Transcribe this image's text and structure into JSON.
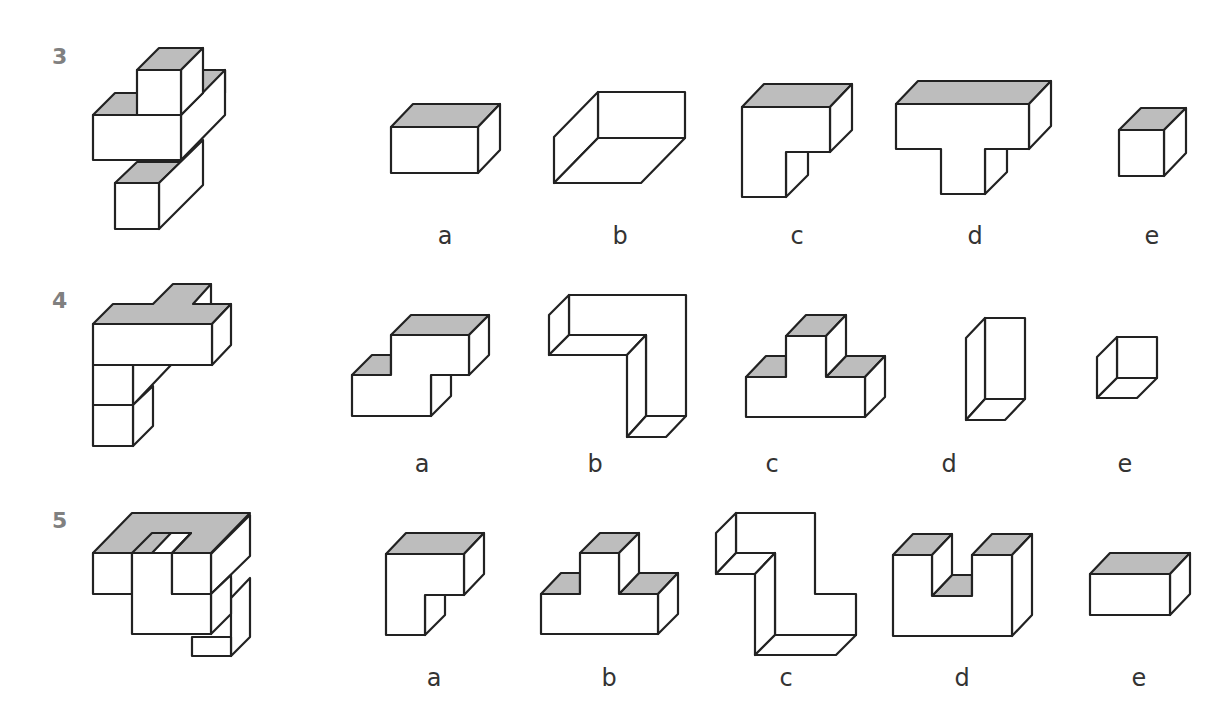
{
  "puzzles": [
    {
      "number": "3",
      "options": [
        {
          "label": "a",
          "shape": "rectangular-block"
        },
        {
          "label": "b",
          "shape": "open-tray"
        },
        {
          "label": "c",
          "shape": "l-block"
        },
        {
          "label": "d",
          "shape": "t-block"
        },
        {
          "label": "e",
          "shape": "cube"
        }
      ]
    },
    {
      "number": "4",
      "options": [
        {
          "label": "a",
          "shape": "step-block"
        },
        {
          "label": "b",
          "shape": "l-frame-hollow"
        },
        {
          "label": "c",
          "shape": "t-step-block"
        },
        {
          "label": "d",
          "shape": "tall-hollow-prism"
        },
        {
          "label": "e",
          "shape": "hollow-cube"
        }
      ]
    },
    {
      "number": "5",
      "options": [
        {
          "label": "a",
          "shape": "l-block"
        },
        {
          "label": "b",
          "shape": "t-step-block"
        },
        {
          "label": "c",
          "shape": "z-frame-hollow"
        },
        {
          "label": "d",
          "shape": "u-block"
        },
        {
          "label": "e",
          "shape": "rectangular-block"
        }
      ]
    }
  ],
  "colors": {
    "face_shaded": "#bdbdbd",
    "outline": "#222222",
    "number_text": "#808080",
    "label_text": "#333333"
  }
}
